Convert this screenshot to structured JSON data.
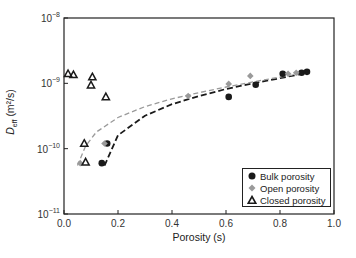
{
  "chart_data": {
    "type": "scatter",
    "title": "",
    "xlabel": "Porosity (s)",
    "ylabel": "D_eff (m²/s)",
    "xlim": [
      0.0,
      1.0
    ],
    "ylim": [
      1e-11,
      1e-08
    ],
    "yscale": "log",
    "grid": false,
    "legend_position": "lower right",
    "x_ticks": [
      "0.0",
      "0.2",
      "0.4",
      "0.6",
      "0.8",
      "1.0"
    ],
    "y_ticks": [
      "10^-11",
      "10^-10",
      "10^-9",
      "10^-8"
    ],
    "series": [
      {
        "name": "Bulk porosity",
        "marker": "filled-circle",
        "color": "#1a1a1a",
        "points": [
          {
            "x": 0.14,
            "y": 6e-11
          },
          {
            "x": 0.16,
            "y": 1.2e-10
          },
          {
            "x": 0.61,
            "y": 6.2e-10
          },
          {
            "x": 0.71,
            "y": 9.5e-10
          },
          {
            "x": 0.81,
            "y": 1.4e-09
          },
          {
            "x": 0.88,
            "y": 1.45e-09
          },
          {
            "x": 0.9,
            "y": 1.5e-09
          }
        ]
      },
      {
        "name": "Open porosity",
        "marker": "diamond",
        "color": "#9a9a9a",
        "points": [
          {
            "x": 0.06,
            "y": 6e-11
          },
          {
            "x": 0.15,
            "y": 1.2e-10
          },
          {
            "x": 0.46,
            "y": 6.4e-10
          },
          {
            "x": 0.61,
            "y": 9.8e-10
          },
          {
            "x": 0.69,
            "y": 1.3e-09
          },
          {
            "x": 0.83,
            "y": 1.4e-09
          },
          {
            "x": 0.86,
            "y": 1.45e-09
          }
        ]
      },
      {
        "name": "Closed porosity",
        "marker": "open-triangle",
        "color": "#1a1a1a",
        "points": [
          {
            "x": 0.015,
            "y": 1.4e-09
          },
          {
            "x": 0.035,
            "y": 1.35e-09
          },
          {
            "x": 0.105,
            "y": 1.25e-09
          },
          {
            "x": 0.1,
            "y": 9.4e-10
          },
          {
            "x": 0.155,
            "y": 6.2e-10
          },
          {
            "x": 0.075,
            "y": 1.2e-10
          },
          {
            "x": 0.08,
            "y": 6.2e-11
          }
        ]
      }
    ],
    "fit_curves": [
      {
        "name": "Bulk fit",
        "style": "dashed",
        "color": "#1a1a1a",
        "points": [
          {
            "x": 0.15,
            "y": 5.5e-11
          },
          {
            "x": 0.2,
            "y": 1.6e-10
          },
          {
            "x": 0.3,
            "y": 3.2e-10
          },
          {
            "x": 0.4,
            "y": 4.8e-10
          },
          {
            "x": 0.5,
            "y": 6.4e-10
          },
          {
            "x": 0.6,
            "y": 8.2e-10
          },
          {
            "x": 0.7,
            "y": 1e-09
          },
          {
            "x": 0.8,
            "y": 1.2e-09
          },
          {
            "x": 0.9,
            "y": 1.45e-09
          }
        ]
      },
      {
        "name": "Open fit",
        "style": "dashed",
        "color": "#9a9a9a",
        "points": [
          {
            "x": 0.05,
            "y": 5.5e-11
          },
          {
            "x": 0.08,
            "y": 1.1e-10
          },
          {
            "x": 0.12,
            "y": 1.8e-10
          },
          {
            "x": 0.2,
            "y": 3e-10
          },
          {
            "x": 0.3,
            "y": 4.4e-10
          },
          {
            "x": 0.4,
            "y": 5.8e-10
          },
          {
            "x": 0.5,
            "y": 7.2e-10
          },
          {
            "x": 0.6,
            "y": 8.8e-10
          },
          {
            "x": 0.7,
            "y": 1.05e-09
          },
          {
            "x": 0.8,
            "y": 1.25e-09
          },
          {
            "x": 0.9,
            "y": 1.45e-09
          }
        ]
      }
    ]
  },
  "axes": {
    "xlabel": "Porosity (s)",
    "ylabel_main": "D",
    "ylabel_sub": "eff",
    "ylabel_unit": " (m²/s)"
  },
  "legend": {
    "items": [
      {
        "label": "Bulk porosity"
      },
      {
        "label": "Open porosity"
      },
      {
        "label": "Closed porosity"
      }
    ]
  }
}
